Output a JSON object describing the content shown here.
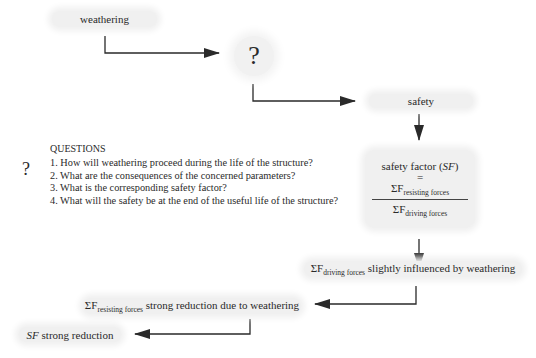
{
  "flow": {
    "weathering": "weathering",
    "unknown_node": "?",
    "safety": "safety",
    "safety_factor": {
      "title": "safety factor",
      "abbr": "SF",
      "equals": "=",
      "numerator_symbol": "ΣF",
      "numerator_sub": "resisting forces",
      "denominator_symbol": "ΣF",
      "denominator_sub": "driving forces"
    },
    "driving_node": {
      "symbol": "ΣF",
      "sub": "driving forces",
      "text": " slightly influenced by weathering"
    },
    "resisting_node": {
      "symbol": "ΣF",
      "sub": "resisting forces",
      "text": " strong reduction due to weathering"
    },
    "sf_node": {
      "abbr": "SF",
      "text": " strong reduction"
    }
  },
  "questions": {
    "icon": "?",
    "title": "QUESTIONS",
    "items": [
      "1. How will weathering proceed during the life of the structure?",
      "2. What are the consequences of the concerned parameters?",
      "3. What is the corresponding safety factor?",
      "4. What will the safety be at the end of the useful life of the structure?"
    ]
  },
  "colors": {
    "box": "#f0f0f0",
    "line": "#2a2a2a"
  }
}
